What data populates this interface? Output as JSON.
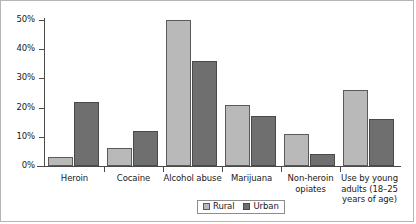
{
  "chart_data": {
    "type": "bar",
    "title": "",
    "subtitle": "",
    "xlabel": "",
    "ylabel": "",
    "ylim": [
      0,
      50
    ],
    "ytick_labels": [
      "0%",
      "10%",
      "20%",
      "30%",
      "40%",
      "50%"
    ],
    "ytick_values": [
      0,
      10,
      20,
      30,
      40,
      50
    ],
    "grid": false,
    "legend_position": "bottom-center",
    "categories": [
      "Heroin",
      "Cocaine",
      "Alcohol abuse",
      "Marijuana",
      "Non-heroin opiates",
      "Use by young adults (18–25 years of age)"
    ],
    "category_label_lines": [
      [
        "Heroin"
      ],
      [
        "Cocaine"
      ],
      [
        "Alcohol abuse"
      ],
      [
        "Marijuana"
      ],
      [
        "Non-heroin",
        "opiates"
      ],
      [
        "Use by young",
        "adults (18–25",
        "years of age)"
      ]
    ],
    "series": [
      {
        "name": "Rural",
        "color": "#b9b9b9",
        "values": [
          3,
          6,
          50,
          21,
          11,
          26
        ]
      },
      {
        "name": "Urban",
        "color": "#6f6f6f",
        "values": [
          22,
          12,
          36,
          17,
          4,
          16
        ]
      }
    ]
  },
  "legend": {
    "entries": [
      {
        "label": "Rural",
        "swatch": "rural"
      },
      {
        "label": "Urban",
        "swatch": "urban"
      }
    ]
  },
  "colors": {
    "rural": "#b9b9b9",
    "urban": "#6f6f6f",
    "axis": "#4a4a4a",
    "border": "#b5b5b5",
    "background": "#ffffff",
    "text": "#1a1a1a"
  }
}
